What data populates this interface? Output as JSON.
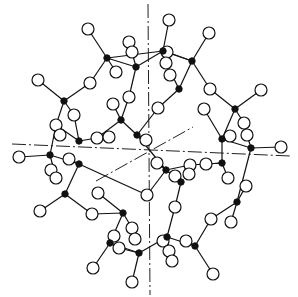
{
  "diagram": {
    "title": "",
    "colors": {
      "background": "#ffffff",
      "ink": "#111111"
    },
    "atom_radius": {
      "open": 6,
      "filled": 3.2
    },
    "axes": [
      {
        "name": "vertical-axis",
        "x1": 148,
        "y1": 4,
        "x2": 150,
        "y2": 295
      },
      {
        "name": "horizontal-axis",
        "x1": 12,
        "y1": 144,
        "x2": 290,
        "y2": 156
      },
      {
        "name": "oblique-axis",
        "x1": 96,
        "y1": 181,
        "x2": 193,
        "y2": 127
      }
    ],
    "filled_atoms": [
      [
        107,
        58
      ],
      [
        136,
        67
      ],
      [
        64,
        101
      ],
      [
        121,
        120
      ],
      [
        137,
        135
      ],
      [
        79,
        141
      ],
      [
        163,
        51
      ],
      [
        192,
        61
      ],
      [
        179,
        89
      ],
      [
        235,
        109
      ],
      [
        222,
        139
      ],
      [
        251,
        148
      ],
      [
        50,
        155
      ],
      [
        79,
        164
      ],
      [
        65,
        194
      ],
      [
        123,
        213
      ],
      [
        110,
        243
      ],
      [
        139,
        253
      ],
      [
        166,
        170
      ],
      [
        181,
        182
      ],
      [
        222,
        163
      ],
      [
        237,
        202
      ],
      [
        167,
        237
      ],
      [
        195,
        246
      ]
    ],
    "open_atoms": [
      [
        88,
        29
      ],
      [
        129,
        42
      ],
      [
        132,
        52
      ],
      [
        38,
        80
      ],
      [
        90,
        83
      ],
      [
        116,
        72
      ],
      [
        129,
        97
      ],
      [
        113,
        104
      ],
      [
        74,
        115
      ],
      [
        56,
        125
      ],
      [
        60,
        135
      ],
      [
        97,
        138
      ],
      [
        109,
        137
      ],
      [
        146,
        140
      ],
      [
        169,
        20
      ],
      [
        209,
        33
      ],
      [
        167,
        52
      ],
      [
        166,
        63
      ],
      [
        170,
        75
      ],
      [
        210,
        89
      ],
      [
        261,
        90
      ],
      [
        204,
        109
      ],
      [
        158,
        108
      ],
      [
        244,
        123
      ],
      [
        247,
        135
      ],
      [
        230,
        136
      ],
      [
        281,
        147
      ],
      [
        19,
        157
      ],
      [
        69,
        159
      ],
      [
        51,
        170
      ],
      [
        56,
        178
      ],
      [
        40,
        211
      ],
      [
        98,
        193
      ],
      [
        92,
        214
      ],
      [
        147,
        195
      ],
      [
        132,
        228
      ],
      [
        114,
        236
      ],
      [
        119,
        248
      ],
      [
        135,
        239
      ],
      [
        93,
        268
      ],
      [
        132,
        282
      ],
      [
        190,
        165
      ],
      [
        206,
        164
      ],
      [
        157,
        163
      ],
      [
        175,
        176
      ],
      [
        189,
        174
      ],
      [
        175,
        207
      ],
      [
        228,
        178
      ],
      [
        246,
        186
      ],
      [
        231,
        222
      ],
      [
        211,
        219
      ],
      [
        163,
        241
      ],
      [
        186,
        241
      ],
      [
        169,
        251
      ],
      [
        172,
        261
      ],
      [
        213,
        274
      ]
    ],
    "bonds": [
      [
        88,
        29,
        107,
        58
      ],
      [
        107,
        58,
        136,
        67
      ],
      [
        107,
        58,
        116,
        72
      ],
      [
        107,
        58,
        163,
        51
      ],
      [
        136,
        67,
        163,
        51
      ],
      [
        136,
        67,
        129,
        97
      ],
      [
        136,
        67,
        132,
        52
      ],
      [
        107,
        58,
        90,
        83
      ],
      [
        90,
        83,
        64,
        101
      ],
      [
        64,
        101,
        38,
        80
      ],
      [
        64,
        101,
        74,
        115
      ],
      [
        64,
        101,
        56,
        125
      ],
      [
        56,
        125,
        50,
        155
      ],
      [
        129,
        97,
        121,
        120
      ],
      [
        121,
        120,
        113,
        104
      ],
      [
        121,
        120,
        137,
        135
      ],
      [
        121,
        120,
        97,
        138
      ],
      [
        97,
        138,
        79,
        141
      ],
      [
        79,
        141,
        74,
        115
      ],
      [
        79,
        141,
        56,
        125
      ],
      [
        137,
        135,
        146,
        140
      ],
      [
        137,
        135,
        166,
        170
      ],
      [
        163,
        51,
        169,
        20
      ],
      [
        163,
        51,
        192,
        61
      ],
      [
        192,
        61,
        209,
        33
      ],
      [
        192,
        61,
        167,
        52
      ],
      [
        192,
        61,
        179,
        89
      ],
      [
        179,
        89,
        166,
        63
      ],
      [
        179,
        89,
        158,
        108
      ],
      [
        158,
        108,
        137,
        135
      ],
      [
        192,
        61,
        210,
        89
      ],
      [
        210,
        89,
        235,
        109
      ],
      [
        235,
        109,
        261,
        90
      ],
      [
        235,
        109,
        244,
        123
      ],
      [
        235,
        109,
        222,
        139
      ],
      [
        222,
        139,
        204,
        109
      ],
      [
        222,
        139,
        230,
        136
      ],
      [
        222,
        139,
        251,
        148
      ],
      [
        251,
        148,
        281,
        147
      ],
      [
        251,
        148,
        247,
        135
      ],
      [
        222,
        139,
        222,
        163
      ],
      [
        251,
        148,
        237,
        202
      ],
      [
        19,
        157,
        50,
        155
      ],
      [
        50,
        155,
        79,
        164
      ],
      [
        79,
        164,
        69,
        159
      ],
      [
        79,
        164,
        65,
        194
      ],
      [
        50,
        155,
        56,
        178
      ],
      [
        65,
        194,
        40,
        211
      ],
      [
        65,
        194,
        92,
        214
      ],
      [
        92,
        214,
        123,
        213
      ],
      [
        123,
        213,
        98,
        193
      ],
      [
        79,
        164,
        147,
        195
      ],
      [
        147,
        195,
        166,
        170
      ],
      [
        123,
        213,
        132,
        228
      ],
      [
        123,
        213,
        110,
        243
      ],
      [
        110,
        243,
        114,
        236
      ],
      [
        110,
        243,
        93,
        268
      ],
      [
        110,
        243,
        139,
        253
      ],
      [
        139,
        253,
        119,
        248
      ],
      [
        139,
        253,
        132,
        282
      ],
      [
        139,
        253,
        167,
        237
      ],
      [
        166,
        170,
        157,
        163
      ],
      [
        166,
        170,
        181,
        182
      ],
      [
        181,
        182,
        175,
        176
      ],
      [
        181,
        182,
        175,
        207
      ],
      [
        175,
        207,
        167,
        237
      ],
      [
        166,
        170,
        190,
        165
      ],
      [
        190,
        165,
        222,
        163
      ],
      [
        222,
        163,
        206,
        164
      ],
      [
        222,
        163,
        228,
        178
      ],
      [
        237,
        202,
        246,
        186
      ],
      [
        237,
        202,
        231,
        222
      ],
      [
        237,
        202,
        211,
        219
      ],
      [
        211,
        219,
        195,
        246
      ],
      [
        195,
        246,
        213,
        274
      ],
      [
        195,
        246,
        186,
        241
      ],
      [
        195,
        246,
        167,
        237
      ],
      [
        167,
        237,
        163,
        241
      ],
      [
        167,
        237,
        169,
        251
      ],
      [
        169,
        251,
        172,
        261
      ]
    ]
  }
}
